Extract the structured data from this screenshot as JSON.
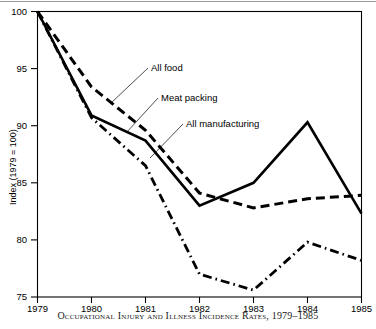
{
  "figure": {
    "caption": "Occupational Injury and Illness Incidence Rates, 1979–1985",
    "y_axis_title": "Index (1979 = 100)"
  },
  "chart_data": {
    "type": "line",
    "title": "Occupational Injury and Illness Incidence Rates, 1979–1985",
    "xlabel": "",
    "ylabel": "Index (1979 = 100)",
    "x": [
      1979,
      1980,
      1981,
      1982,
      1983,
      1984,
      1985
    ],
    "xtick_labels": [
      "1979",
      "1980",
      "1981",
      "1982",
      "1983",
      "1984",
      "1985"
    ],
    "ytick_labels": [
      "75",
      "80",
      "85",
      "90",
      "95",
      "100"
    ],
    "yticks": [
      75,
      80,
      85,
      90,
      95,
      100
    ],
    "xlim": [
      1979,
      1985
    ],
    "ylim": [
      75,
      100
    ],
    "grid": false,
    "legend": "inline annotations",
    "series": [
      {
        "name": "Meat packing",
        "style": "solid",
        "values": [
          100.0,
          90.9,
          88.7,
          83.0,
          85.0,
          90.3,
          82.3
        ]
      },
      {
        "name": "All food",
        "style": "dashed",
        "values": [
          100.0,
          93.4,
          89.6,
          84.1,
          82.8,
          83.6,
          83.9
        ]
      },
      {
        "name": "All manufacturing",
        "style": "dash-dot",
        "values": [
          100.0,
          90.7,
          86.5,
          77.0,
          75.6,
          79.8,
          78.2
        ]
      }
    ],
    "annotations": [
      {
        "label": "All food",
        "x": 150,
        "y": 70
      },
      {
        "label": "Meat packing",
        "x": 160,
        "y": 100
      },
      {
        "label": "All manufacturing",
        "x": 185,
        "y": 126
      }
    ],
    "colors": {
      "line": "#000000",
      "background": "#ffffff",
      "axis": "#000000"
    }
  }
}
